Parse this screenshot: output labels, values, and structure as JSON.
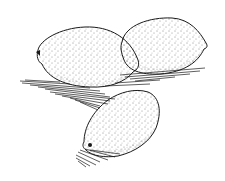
{
  "image": {
    "subject": "Ink stipple drawing of three lemons",
    "width": 225,
    "height": 181,
    "colors": {
      "background": "#ffffff",
      "ink": "#1a1a1a"
    },
    "objects": [
      {
        "name": "left-lemon",
        "cx": 87,
        "cy": 57,
        "rx": 53,
        "ry": 30
      },
      {
        "name": "right-lemon",
        "cx": 163,
        "cy": 45,
        "rx": 45,
        "ry": 27
      },
      {
        "name": "bottom-lemon",
        "cx": 120,
        "cy": 124,
        "rx": 40,
        "ry": 33
      }
    ]
  }
}
